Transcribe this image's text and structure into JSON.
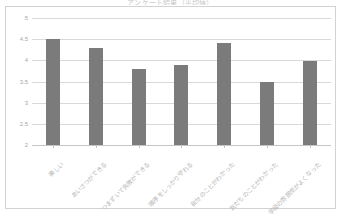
{
  "chart": {
    "title": "アンケート結果（平均値）",
    "frame_border_color": "#d2d2d2",
    "bar_color": "#7b7b7b",
    "gridline_color": "#d9d9d9",
    "axis_text_color": "#b4b4b4"
  },
  "chart_data": {
    "type": "bar",
    "title": "アンケート結果（平均値）",
    "xlabel": "",
    "ylabel": "",
    "ylim": [
      2,
      5
    ],
    "yticks": [
      "2",
      "2.5",
      "3",
      "3.5",
      "4",
      "4.5",
      "5"
    ],
    "ytick_values": [
      2,
      2.5,
      3,
      3.5,
      4,
      4.5,
      5
    ],
    "grid": true,
    "legend": false,
    "categories": [
      "楽しい",
      "あいさつができる",
      "つまずいて失敗ができる",
      "順序をしっかり守れる",
      "自分のことがわかった",
      "友だちのことがわかった",
      "学級の雰囲気がよくなった"
    ],
    "values": [
      4.5,
      4.3,
      3.8,
      3.88,
      4.4,
      3.48,
      3.98
    ]
  }
}
